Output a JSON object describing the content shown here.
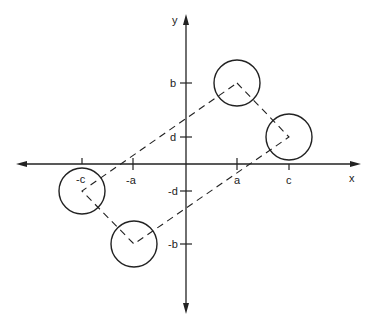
{
  "diagram": {
    "type": "coordinate-plane-figure",
    "axes": {
      "x_label": "x",
      "y_label": "y"
    },
    "x_ticks": [
      {
        "label": "-c",
        "px": 82
      },
      {
        "label": "-a",
        "px": 133
      },
      {
        "label": "a",
        "px": 237
      },
      {
        "label": "c",
        "px": 289
      }
    ],
    "y_ticks": [
      {
        "label": "b",
        "py": 83
      },
      {
        "label": "d",
        "py": 137
      },
      {
        "label": "-d",
        "py": 191
      },
      {
        "label": "-b",
        "py": 244
      }
    ],
    "circles": [
      {
        "center": "(a, b)",
        "cx": 237,
        "cy": 83
      },
      {
        "center": "(c, d)",
        "cx": 289,
        "cy": 137
      },
      {
        "center": "(-c, -d)",
        "cx": 82,
        "cy": 191
      },
      {
        "center": "(-a, -b)",
        "cx": 134,
        "cy": 244
      }
    ],
    "dashed_quadrilateral": [
      "(a, b)",
      "(c, d)",
      "(-a, -b)",
      "(-c, -d)"
    ]
  },
  "labels": {
    "x_axis": "x",
    "y_axis": "y",
    "tick_neg_c": "-c",
    "tick_neg_a": "-a",
    "tick_a": "a",
    "tick_c": "c",
    "tick_b": "b",
    "tick_d": "d",
    "tick_neg_d": "-d",
    "tick_neg_b": "-b"
  }
}
